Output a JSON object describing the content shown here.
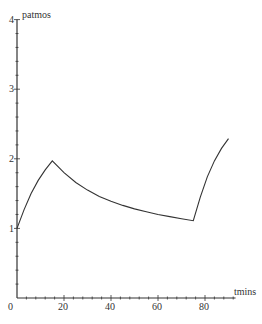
{
  "chart_data": {
    "type": "line",
    "title": "",
    "xlabel": "tmins",
    "ylabel": "patmos",
    "xlim": [
      0,
      93
    ],
    "ylim": [
      0,
      4
    ],
    "grid": false,
    "legend": null,
    "x_ticks": [
      0,
      20,
      40,
      60,
      80
    ],
    "y_ticks": [
      1,
      2,
      3,
      4
    ],
    "x_minor_step": 4,
    "y_minor_step": 0.2,
    "series": [
      {
        "name": "patmos",
        "color": "#333333",
        "x": [
          0,
          3,
          6,
          9,
          12,
          15,
          20,
          25,
          30,
          35,
          40,
          45,
          50,
          55,
          60,
          65,
          70,
          75,
          78,
          81,
          84,
          87,
          90
        ],
        "y": [
          1.0,
          1.27,
          1.5,
          1.69,
          1.84,
          1.97,
          1.8,
          1.66,
          1.55,
          1.46,
          1.39,
          1.33,
          1.28,
          1.24,
          1.2,
          1.17,
          1.14,
          1.11,
          1.45,
          1.74,
          1.97,
          2.15,
          2.29
        ]
      }
    ]
  },
  "axes": {
    "origin_label": "0",
    "x_tick_labels": [
      "20",
      "40",
      "60",
      "80"
    ],
    "y_tick_labels": [
      "1",
      "2",
      "3",
      "4"
    ],
    "x_title": "tmins",
    "y_title": "patmos"
  }
}
